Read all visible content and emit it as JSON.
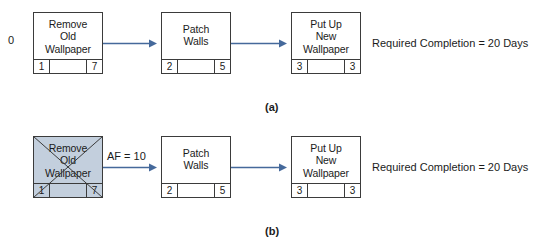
{
  "figure": {
    "caption_a": "(a)",
    "caption_b": "(b)"
  },
  "panel_a": {
    "start_label": "0",
    "note": "Required Completion = 20 Days",
    "nodes": [
      {
        "name": "Remove\nOld\nWallpaper",
        "left_value": "1",
        "right_value": "7"
      },
      {
        "name": "Patch\nWalls",
        "left_value": "2",
        "right_value": "5"
      },
      {
        "name": "Put Up\nNew\nWallpaper",
        "left_value": "3",
        "right_value": "3"
      }
    ]
  },
  "panel_b": {
    "af_label": "AF = 10",
    "note": "Required Completion = 20 Days",
    "nodes": [
      {
        "name": "Remove\nOld\nWallpaper",
        "left_value": "1",
        "right_value": "7",
        "state": "crossed-out"
      },
      {
        "name": "Patch\nWalls",
        "left_value": "2",
        "right_value": "5",
        "state": "normal"
      },
      {
        "name": "Put Up\nNew\nWallpaper",
        "left_value": "3",
        "right_value": "3",
        "state": "normal"
      }
    ]
  },
  "colors": {
    "arrow": "#45699b",
    "node_border": "#3b3b3b",
    "shaded_node_fill": "#c3cfdd",
    "text": "#1b1b1b",
    "background": "#ffffff"
  }
}
